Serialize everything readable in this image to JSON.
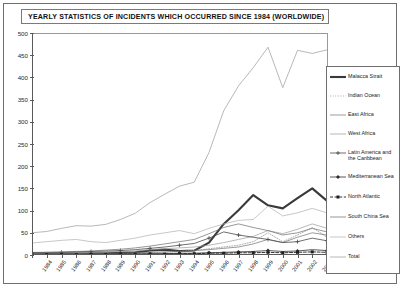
{
  "title": "YEARLY STATISTICS OF INCIDENTS WHICH OCCURRED SINCE 1984 (WORLDWIDE)",
  "legend": {
    "position": "right",
    "entries": [
      {
        "label": "Malacca Strait",
        "marker": "thick-solid-line"
      },
      {
        "label": "Indian Ocean",
        "marker": "dotted-line"
      },
      {
        "label": "East Africa",
        "marker": "solid-line"
      },
      {
        "label": "West Africa",
        "marker": "solid-line"
      },
      {
        "label": "Latin America and the Caribbean",
        "marker": "line-with-cross-marker"
      },
      {
        "label": "Mediterranean Sea",
        "marker": "line-with-diamond-marker"
      },
      {
        "label": "North Atlantic",
        "marker": "dashed-line-with-square-marker"
      },
      {
        "label": "South China Sea",
        "marker": "solid-line"
      },
      {
        "label": "Others",
        "marker": "solid-line"
      },
      {
        "label": "Total",
        "marker": "thin-solid-line"
      }
    ]
  },
  "axes": {
    "y_ticks": [
      "0",
      "50",
      "100",
      "150",
      "200",
      "250",
      "300",
      "350",
      "400",
      "450",
      "500"
    ],
    "x_ticks": [
      "1984",
      "1985",
      "1986",
      "1987",
      "1988",
      "1989",
      "1990",
      "1991",
      "1992",
      "1993",
      "1994",
      "1995",
      "1996",
      "1997",
      "1998",
      "1999",
      "2000",
      "2001",
      "2002",
      "2003",
      "2004"
    ]
  },
  "chart_data": {
    "type": "line",
    "title": "YEARLY STATISTICS OF INCIDENTS WHICH OCCURRED SINCE 1984 (WORLDWIDE)",
    "xlabel": "",
    "ylabel": "",
    "ylim": [
      0,
      500
    ],
    "ytick_step": 50,
    "grid": false,
    "legend_position": "right",
    "categories": [
      "1984",
      "1985",
      "1986",
      "1987",
      "1988",
      "1989",
      "1990",
      "1991",
      "1992",
      "1993",
      "1994",
      "1995",
      "1996",
      "1997",
      "1998",
      "1999",
      "2000",
      "2001",
      "2002",
      "2003",
      "2004"
    ],
    "series": [
      {
        "name": "Malacca Strait",
        "style": "thick-solid-line",
        "color": "#3a3a3a",
        "values": [
          3,
          2,
          3,
          3,
          4,
          4,
          5,
          6,
          10,
          12,
          9,
          10,
          28,
          70,
          101,
          135,
          112,
          105,
          128,
          150,
          122
        ]
      },
      {
        "name": "Indian Ocean",
        "style": "dotted-line",
        "color": "#8a8a8a",
        "values": [
          1,
          1,
          2,
          2,
          2,
          3,
          3,
          4,
          5,
          6,
          8,
          10,
          14,
          18,
          22,
          30,
          50,
          30,
          45,
          62,
          40
        ]
      },
      {
        "name": "East Africa",
        "style": "solid-line",
        "color": "#707070",
        "values": [
          2,
          2,
          2,
          3,
          3,
          4,
          4,
          5,
          6,
          7,
          8,
          10,
          12,
          15,
          18,
          25,
          35,
          28,
          40,
          50,
          45
        ]
      },
      {
        "name": "West Africa",
        "style": "solid-line",
        "color": "#9a9a9a",
        "values": [
          4,
          5,
          5,
          6,
          6,
          7,
          8,
          9,
          12,
          14,
          16,
          18,
          22,
          28,
          35,
          42,
          55,
          48,
          58,
          70,
          60
        ]
      },
      {
        "name": "Latin America and the Caribbean",
        "style": "line-with-cross-marker",
        "color": "#4a4a4a",
        "values": [
          5,
          6,
          6,
          7,
          8,
          9,
          10,
          12,
          15,
          18,
          22,
          26,
          38,
          52,
          45,
          40,
          35,
          28,
          30,
          38,
          32
        ]
      },
      {
        "name": "Mediterranean Sea",
        "style": "line-with-diamond-marker",
        "color": "#2f2f2f",
        "values": [
          1,
          1,
          1,
          1,
          2,
          2,
          2,
          2,
          3,
          3,
          4,
          4,
          5,
          6,
          7,
          8,
          10,
          8,
          9,
          12,
          10
        ]
      },
      {
        "name": "North Atlantic",
        "style": "dashed-line-with-square-marker",
        "color": "#1f1f1f",
        "values": [
          1,
          1,
          1,
          1,
          1,
          1,
          2,
          2,
          2,
          2,
          3,
          3,
          4,
          4,
          5,
          5,
          6,
          5,
          6,
          7,
          6
        ]
      },
      {
        "name": "South China Sea",
        "style": "solid-line",
        "color": "#6a6a6a",
        "values": [
          6,
          6,
          7,
          8,
          9,
          11,
          13,
          16,
          20,
          25,
          30,
          35,
          48,
          62,
          70,
          62,
          55,
          45,
          50,
          60,
          52
        ]
      },
      {
        "name": "Others",
        "style": "solid-line",
        "color": "#b0b0b0",
        "values": [
          27,
          30,
          33,
          35,
          30,
          28,
          33,
          38,
          45,
          50,
          55,
          48,
          60,
          70,
          78,
          80,
          110,
          88,
          95,
          105,
          95
        ]
      },
      {
        "name": "Total",
        "style": "thin-solid-line",
        "color": "#999999",
        "values": [
          50,
          53,
          60,
          66,
          65,
          69,
          80,
          94,
          118,
          137,
          155,
          164,
          231,
          325,
          381,
          422,
          468,
          377,
          461,
          454,
          462
        ]
      }
    ]
  }
}
